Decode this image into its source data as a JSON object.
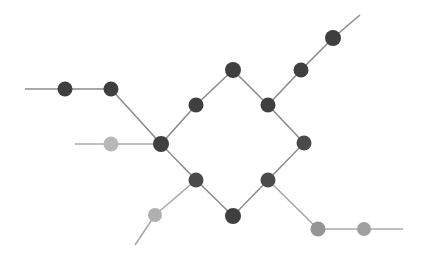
{
  "figure": {
    "kind": "node-link-graph",
    "background": "#ffffff",
    "width": 428,
    "height": 263,
    "title": ""
  },
  "style": {
    "node_radius": 7.5,
    "node_radius_small": 7.0,
    "edge_width": 1.6,
    "colors": {
      "dark": "#3f3f3f",
      "medium": "#808080",
      "light": "#b8b8b8",
      "edge": "#8c8c8c",
      "edge_light": "#a8a8a8"
    }
  },
  "chart_data": {
    "type": "graph",
    "title": "",
    "xlabel": "",
    "ylabel": "",
    "xlim": [
      0,
      428
    ],
    "ylim": [
      0,
      263
    ],
    "grid": false,
    "legend": null,
    "node_count": 16,
    "edge_count": 21,
    "nodes": [
      {
        "id": "n0",
        "label": "",
        "x": 65,
        "y": 89,
        "color": "#3f3f3f",
        "shade": "dark",
        "r": 7.5
      },
      {
        "id": "n1",
        "label": "",
        "x": 111,
        "y": 89,
        "color": "#3f3f3f",
        "shade": "dark",
        "r": 7.5
      },
      {
        "id": "n2",
        "label": "",
        "x": 111,
        "y": 144,
        "color": "#b8b8b8",
        "shade": "light",
        "r": 7.5
      },
      {
        "id": "n3",
        "label": "",
        "x": 161,
        "y": 144,
        "color": "#3f3f3f",
        "shade": "dark",
        "r": 8.0
      },
      {
        "id": "n4",
        "label": "",
        "x": 196,
        "y": 105,
        "color": "#3f3f3f",
        "shade": "dark",
        "r": 7.5
      },
      {
        "id": "n5",
        "label": "",
        "x": 233,
        "y": 70,
        "color": "#3f3f3f",
        "shade": "dark",
        "r": 8.0
      },
      {
        "id": "n6",
        "label": "",
        "x": 268,
        "y": 105,
        "color": "#3f3f3f",
        "shade": "dark",
        "r": 7.5
      },
      {
        "id": "n7",
        "label": "",
        "x": 301,
        "y": 70,
        "color": "#3f3f3f",
        "shade": "dark",
        "r": 7.5
      },
      {
        "id": "n8",
        "label": "",
        "x": 333,
        "y": 38,
        "color": "#3f3f3f",
        "shade": "dark",
        "r": 8.0
      },
      {
        "id": "n9",
        "label": "",
        "x": 304,
        "y": 143,
        "color": "#4a4a4a",
        "shade": "dark",
        "r": 7.5
      },
      {
        "id": "n10",
        "label": "",
        "x": 268,
        "y": 180,
        "color": "#4a4a4a",
        "shade": "dark",
        "r": 7.5
      },
      {
        "id": "n11",
        "label": "",
        "x": 233,
        "y": 216,
        "color": "#3f3f3f",
        "shade": "dark",
        "r": 8.0
      },
      {
        "id": "n12",
        "label": "",
        "x": 196,
        "y": 180,
        "color": "#4a4a4a",
        "shade": "dark",
        "r": 7.5
      },
      {
        "id": "n13",
        "label": "",
        "x": 155,
        "y": 215,
        "color": "#b0b0b0",
        "shade": "light",
        "r": 7.0
      },
      {
        "id": "n14",
        "label": "",
        "x": 318,
        "y": 229,
        "color": "#949494",
        "shade": "medium",
        "r": 7.5
      },
      {
        "id": "n15",
        "label": "",
        "x": 364,
        "y": 229,
        "color": "#a0a0a0",
        "shade": "medium",
        "r": 7.0
      }
    ],
    "terminals": [
      {
        "id": "t_left_upper",
        "x": 25,
        "y": 89
      },
      {
        "id": "t_left_mid",
        "x": 75,
        "y": 144
      },
      {
        "id": "t_top_right",
        "x": 360,
        "y": 15
      },
      {
        "id": "t_bottom_left",
        "x": 135,
        "y": 245
      },
      {
        "id": "t_bottom_right",
        "x": 403,
        "y": 229
      }
    ],
    "edges": [
      {
        "from": "t_left_upper",
        "to": "n0",
        "color": "#8c8c8c"
      },
      {
        "from": "n0",
        "to": "n1",
        "color": "#8c8c8c"
      },
      {
        "from": "n1",
        "to": "n3",
        "color": "#8c8c8c"
      },
      {
        "from": "t_left_mid",
        "to": "n2",
        "color": "#a8a8a8"
      },
      {
        "from": "n2",
        "to": "n3",
        "color": "#a8a8a8"
      },
      {
        "from": "n3",
        "to": "n4",
        "color": "#8c8c8c"
      },
      {
        "from": "n4",
        "to": "n5",
        "color": "#8c8c8c"
      },
      {
        "from": "n5",
        "to": "n6",
        "color": "#8c8c8c"
      },
      {
        "from": "n6",
        "to": "n7",
        "color": "#8c8c8c"
      },
      {
        "from": "n7",
        "to": "n8",
        "color": "#8c8c8c"
      },
      {
        "from": "n8",
        "to": "t_top_right",
        "color": "#8c8c8c"
      },
      {
        "from": "n6",
        "to": "n9",
        "color": "#8c8c8c"
      },
      {
        "from": "n9",
        "to": "n10",
        "color": "#8c8c8c"
      },
      {
        "from": "n10",
        "to": "n11",
        "color": "#8c8c8c"
      },
      {
        "from": "n11",
        "to": "n12",
        "color": "#8c8c8c"
      },
      {
        "from": "n12",
        "to": "n3",
        "color": "#8c8c8c"
      },
      {
        "from": "n12",
        "to": "n13",
        "color": "#a8a8a8"
      },
      {
        "from": "n13",
        "to": "t_bottom_left",
        "color": "#a8a8a8"
      },
      {
        "from": "n10",
        "to": "n14",
        "color": "#a8a8a8"
      },
      {
        "from": "n14",
        "to": "n15",
        "color": "#a8a8a8"
      },
      {
        "from": "n15",
        "to": "t_bottom_right",
        "color": "#a8a8a8"
      }
    ]
  }
}
